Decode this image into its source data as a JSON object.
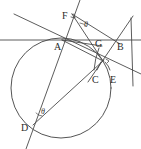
{
  "figure": {
    "type": "geometry-diagram",
    "stroke_color": "#4a4a4a",
    "label_color": "#2b2b2b",
    "background": "#ffffff",
    "width": 141,
    "height": 149
  },
  "circle": {
    "cx": 61,
    "cy": 88,
    "r": 50
  },
  "points": [
    {
      "id": "A",
      "label": "A",
      "x": 62,
      "y": 40,
      "label_x": 54,
      "label_y": 42
    },
    {
      "id": "B",
      "label": "B",
      "x": 113,
      "y": 40,
      "label_x": 117,
      "label_y": 42
    },
    {
      "id": "C",
      "label": "C",
      "x": 97,
      "y": 66,
      "label_x": 92,
      "label_y": 75
    },
    {
      "id": "D",
      "label": "D",
      "x": 33,
      "y": 125,
      "label_x": 21,
      "label_y": 123
    },
    {
      "id": "E",
      "label": "E",
      "x": 110,
      "y": 66,
      "label_x": 110,
      "label_y": 75
    },
    {
      "id": "F",
      "label": "F",
      "x": 72,
      "y": 14,
      "label_x": 62,
      "label_y": 11
    },
    {
      "id": "G",
      "label": "G",
      "x": 100,
      "y": 44,
      "label_x": 95,
      "label_y": 39
    },
    {
      "id": "P",
      "label": "",
      "x": 103,
      "y": 61,
      "label_x": 0,
      "label_y": 0
    }
  ],
  "angle_marks": [
    {
      "id": "theta-F",
      "label": "θ",
      "x": 84,
      "y": 21
    },
    {
      "id": "theta-D",
      "label": "θ",
      "x": 41,
      "y": 108
    }
  ],
  "right_angles": [
    {
      "id": "right-angle-F",
      "at": "F"
    },
    {
      "id": "right-angle-P",
      "at": "P"
    }
  ],
  "segments": [
    {
      "id": "line-AB",
      "from": "A",
      "to": "B",
      "note": "horizontal secant through A and B, extended both ways"
    },
    {
      "id": "line-FD",
      "from": "F",
      "to": "D",
      "note": "steep line through F, A-region and D, extended"
    },
    {
      "id": "line-FB",
      "from": "F",
      "to": "B",
      "note": "line from F down-right to B"
    },
    {
      "id": "line-FP",
      "from": "F",
      "to": "P",
      "note": "line from F to lower intersection point"
    },
    {
      "id": "line-AP",
      "from": "A",
      "to": "P",
      "note": "chord from A to intersection point"
    },
    {
      "id": "line-AG",
      "from": "A",
      "to": "G",
      "note": "short segment A to G"
    },
    {
      "id": "line-BP",
      "from": "B",
      "to": "P",
      "note": "line through B and P extended both directions"
    },
    {
      "id": "line-DP",
      "from": "D",
      "to": "P",
      "note": "long chord D to P"
    },
    {
      "id": "line-GC",
      "from": "G",
      "to": "C",
      "note": "pointer from G region toward C"
    },
    {
      "id": "line-PE",
      "from": "P",
      "to": "E",
      "note": "pointer toward E"
    },
    {
      "id": "line-upperleft",
      "from": "",
      "to": "",
      "note": "line from upper-left descending to the right through A region"
    }
  ]
}
